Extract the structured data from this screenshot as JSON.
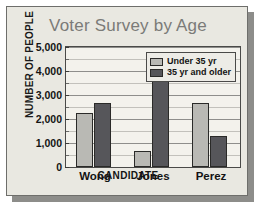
{
  "chart_data": {
    "type": "bar",
    "title": "Voter Survey by Age",
    "xlabel": "CANDIDATE",
    "ylabel": "NUMBER OF PEOPLE",
    "categories": [
      "Wong",
      "Jones",
      "Perez"
    ],
    "series": [
      {
        "name": "Under 35 yr",
        "values": [
          2250,
          650,
          2650
        ],
        "color": "#b9b9b4"
      },
      {
        "name": "35 yr and older",
        "values": [
          2650,
          3650,
          1300
        ],
        "color": "#56565a"
      }
    ],
    "ylim": [
      0,
      5000
    ],
    "ytick_labels": [
      "0",
      "1,000",
      "2,000",
      "3,000",
      "4,000",
      "5,000"
    ],
    "ytick_values": [
      0,
      1000,
      2000,
      3000,
      4000,
      5000
    ],
    "minor_tick_step": 500,
    "grid": true,
    "legend_position": "top-right-inside"
  },
  "legend": {
    "entries": [
      {
        "label": "Under 35 yr"
      },
      {
        "label": "35 yr and older"
      }
    ]
  }
}
